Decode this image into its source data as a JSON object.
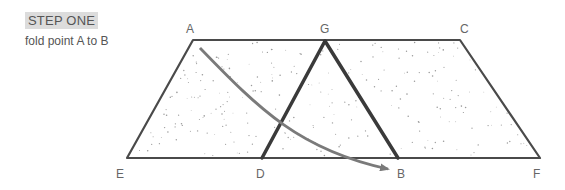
{
  "step": {
    "title": "STEP ONE",
    "instruction": "fold point A to B"
  },
  "points": {
    "A": "A",
    "G": "G",
    "C": "C",
    "E": "E",
    "D": "D",
    "B": "B",
    "F": "F"
  },
  "colors": {
    "outline": "#4a4a4a",
    "fold_lines": "#3a3a3a",
    "arrow": "#7a7a7a",
    "stipple": "#9a9a9a"
  }
}
